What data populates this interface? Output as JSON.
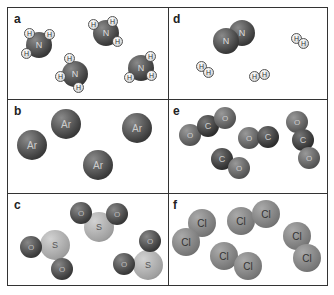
{
  "figure": {
    "panels": [
      {
        "label": "a",
        "species": "NH3",
        "atoms": [
          "N",
          "H"
        ]
      },
      {
        "label": "b",
        "species": "Ar",
        "atoms": [
          "Ar"
        ]
      },
      {
        "label": "c",
        "species": "SO2",
        "atoms": [
          "S",
          "O"
        ]
      },
      {
        "label": "d",
        "species": "N2 + H2",
        "atoms": [
          "N",
          "H"
        ]
      },
      {
        "label": "e",
        "species": "CO + CO2",
        "atoms": [
          "C",
          "O"
        ]
      },
      {
        "label": "f",
        "species": "Cl2",
        "atoms": [
          "Cl"
        ]
      }
    ],
    "symbols": {
      "N": "N",
      "H": "H",
      "Ar": "Ar",
      "O": "O",
      "C": "C",
      "S": "S",
      "Cl": "Cl"
    }
  }
}
